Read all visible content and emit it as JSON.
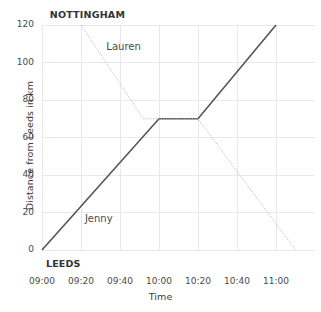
{
  "chart_data": {
    "type": "line",
    "title": "",
    "xlabel": "Time",
    "ylabel": "Distance from Leeds in km",
    "xlim": [
      0,
      140
    ],
    "ylim": [
      0,
      120
    ],
    "grid": true,
    "legend_position": "inline-annotation",
    "x_tick_labels": [
      "09:00",
      "09:20",
      "09:40",
      "10:00",
      "10:20",
      "10:40",
      "11:00"
    ],
    "x_tick_minutes": [
      0,
      20,
      40,
      60,
      80,
      100,
      120
    ],
    "y_tick_labels": [
      "0",
      "20",
      "40",
      "60",
      "80",
      "100",
      "120"
    ],
    "y_tick_values": [
      0,
      20,
      40,
      60,
      80,
      100,
      120
    ],
    "annotations": [
      {
        "name": "nottingham-endpoint",
        "text": "NOTTINGHAM",
        "at_value": 120
      },
      {
        "name": "leeds-endpoint",
        "text": "LEEDS",
        "at_value": 0
      }
    ],
    "series": [
      {
        "name": "Jenny",
        "style": "solid",
        "color": "#555555",
        "points": [
          {
            "time": "09:00",
            "minutes": 0,
            "distance": 0
          },
          {
            "time": "10:00",
            "minutes": 60,
            "distance": 70
          },
          {
            "time": "10:20",
            "minutes": 80,
            "distance": 70
          },
          {
            "time": "11:00",
            "minutes": 120,
            "distance": 120
          }
        ]
      },
      {
        "name": "Lauren",
        "style": "dotted",
        "color": "#b0b0b0",
        "points": [
          {
            "time": "09:20",
            "minutes": 20,
            "distance": 120
          },
          {
            "time": "09:52",
            "minutes": 52,
            "distance": 70
          },
          {
            "time": "10:20",
            "minutes": 80,
            "distance": 70
          },
          {
            "time": "11:10",
            "minutes": 130,
            "distance": 0
          }
        ]
      }
    ]
  },
  "axes": {
    "y_title": "Distance from Leeds in km",
    "x_title": "Time"
  },
  "labels": {
    "nottingham": "NOTTINGHAM",
    "leeds": "LEEDS",
    "lauren": "Lauren",
    "jenny": "Jenny"
  },
  "ticks": {
    "y": [
      "120",
      "100",
      "80",
      "60",
      "40",
      "20",
      "0"
    ],
    "x": [
      "09:00",
      "09:20",
      "09:40",
      "10:00",
      "10:20",
      "10:40",
      "11:00"
    ]
  },
  "colors": {
    "jenny_line": "#555555",
    "lauren_line": "#b0b0b0",
    "grid": "#e8e8e8",
    "text": "#3f3f3f"
  }
}
